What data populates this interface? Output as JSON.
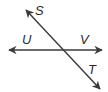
{
  "diagram": {
    "type": "intersecting-lines",
    "colors": {
      "line": "#3a3a3a",
      "label": "#2a2a2a",
      "background": "#ffffff"
    },
    "lines": [
      {
        "id": "UV",
        "from": [
          9,
          50
        ],
        "to": [
          102,
          50
        ],
        "arrows": "both"
      },
      {
        "id": "ST",
        "from": [
          26,
          10
        ],
        "to": [
          100,
          89
        ],
        "arrows": "both"
      }
    ],
    "labels": {
      "S": {
        "text": "S",
        "x": 35,
        "y": 15
      },
      "U": {
        "text": "U",
        "x": 22,
        "y": 44
      },
      "V": {
        "text": "V",
        "x": 80,
        "y": 44
      },
      "T": {
        "text": "T",
        "x": 88,
        "y": 74
      }
    }
  }
}
